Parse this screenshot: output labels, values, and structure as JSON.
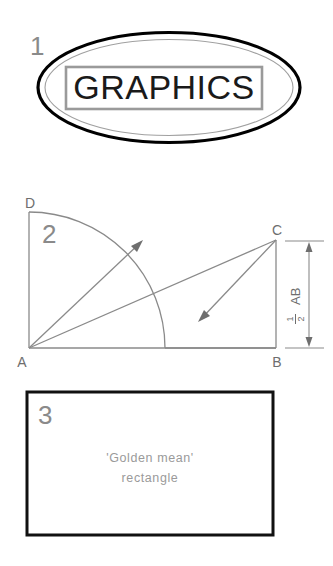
{
  "page": {
    "background_color": "#ffffff",
    "width": 333,
    "height": 566
  },
  "figures": [
    {
      "number": "1",
      "type": "ellipse-with-label-box",
      "label": "GRAPHICS",
      "outline_color": "#000000",
      "inner_outline_color": "#9a9a9a",
      "box_border_color": "#9a9a9a",
      "text_color": "#1a1a1a"
    },
    {
      "number": "2",
      "type": "golden-mean-construction",
      "points": {
        "a": "A",
        "b": "B",
        "c": "C",
        "d": "D"
      },
      "dimension": {
        "numerator": "1",
        "denominator": "2",
        "segment": "AB"
      },
      "line_color": "#8a8a8a"
    },
    {
      "number": "3",
      "type": "rectangle-with-caption",
      "caption_line1": "'Golden mean'",
      "caption_line2": "rectangle",
      "border_color": "#111111",
      "caption_color": "#9a9a9a"
    }
  ]
}
